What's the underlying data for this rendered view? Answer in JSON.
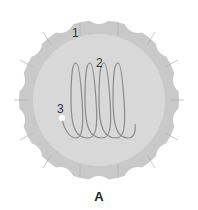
{
  "figure": {
    "caption": "A",
    "labels": {
      "label_1": "1",
      "label_2": "2",
      "label_3": "3"
    },
    "colors": {
      "outer_disc": "#c8c8c8",
      "inner_disc": "#d9d9d9",
      "coil": "#8a8a8a",
      "dot": "#ffffff"
    },
    "lobe_count": 14,
    "coil_loops": 5
  }
}
